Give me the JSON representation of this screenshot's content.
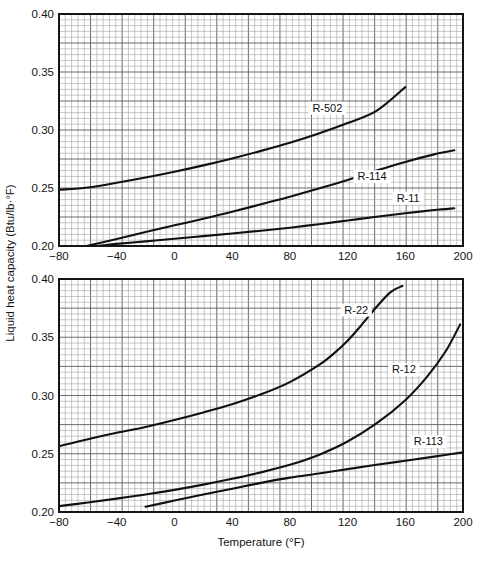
{
  "figure": {
    "axis_titles": {
      "y": "Liquid heat capacity (Btu/lb·°F)",
      "x": "Temperature (°F)"
    },
    "x_ticks": [
      "−80",
      "−40",
      "0",
      "40",
      "80",
      "120",
      "160",
      "200"
    ],
    "y_ticks": [
      "0.40",
      "0.35",
      "0.30",
      "0.25",
      "0.20"
    ],
    "grid_color": "#9a9a9a",
    "grid_major_color": "#5a5a5a",
    "frame_color": "#151515",
    "curve_color": "#111111"
  },
  "chart_data": [
    {
      "type": "line",
      "panel": "top",
      "title": "",
      "xlabel": "",
      "ylabel": "Liquid heat capacity (Btu/lb·°F)",
      "xlim": [
        -80,
        200
      ],
      "ylim": [
        0.2,
        0.4
      ],
      "x_ticks": [
        -80,
        -40,
        0,
        40,
        80,
        120,
        160,
        200
      ],
      "y_ticks": [
        0.2,
        0.25,
        0.3,
        0.35,
        0.4
      ],
      "grid": true,
      "legend": "inline-curve-labels",
      "series": [
        {
          "name": "R-502",
          "label": "R-502",
          "label_xy": [
            106,
            0.3175
          ],
          "x": [
            -80,
            -60,
            -40,
            -20,
            0,
            20,
            40,
            60,
            80,
            100,
            120,
            140,
            160
          ],
          "y": [
            0.2485,
            0.2505,
            0.2545,
            0.259,
            0.264,
            0.2695,
            0.2755,
            0.282,
            0.289,
            0.297,
            0.306,
            0.3165,
            0.337
          ]
        },
        {
          "name": "R-114",
          "label": "R-114",
          "label_xy": [
            137,
            0.2585
          ],
          "x": [
            -61,
            -40,
            -20,
            0,
            20,
            40,
            60,
            80,
            100,
            120,
            140,
            160,
            180,
            194
          ],
          "y": [
            0.2,
            0.206,
            0.212,
            0.2178,
            0.2235,
            0.2295,
            0.236,
            0.2425,
            0.2495,
            0.257,
            0.265,
            0.2725,
            0.279,
            0.2825
          ]
        },
        {
          "name": "R-11",
          "label": "R-11",
          "label_xy": [
            162,
            0.24
          ],
          "x": [
            -53,
            -40,
            -20,
            0,
            20,
            40,
            60,
            80,
            100,
            120,
            140,
            160,
            180,
            194
          ],
          "y": [
            0.2,
            0.2018,
            0.204,
            0.2062,
            0.2085,
            0.2108,
            0.2132,
            0.2158,
            0.2188,
            0.222,
            0.2252,
            0.2282,
            0.231,
            0.2325
          ]
        }
      ]
    },
    {
      "type": "line",
      "panel": "bottom",
      "title": "",
      "xlabel": "Temperature (°F)",
      "ylabel": "Liquid heat capacity (Btu/lb·°F)",
      "xlim": [
        -80,
        200
      ],
      "ylim": [
        0.2,
        0.4
      ],
      "x_ticks": [
        -80,
        -40,
        0,
        40,
        80,
        120,
        160,
        200
      ],
      "y_ticks": [
        0.2,
        0.25,
        0.3,
        0.35,
        0.4
      ],
      "grid": true,
      "legend": "inline-curve-labels",
      "series": [
        {
          "name": "R-22",
          "label": "R-22",
          "label_xy": [
            126,
            0.372
          ],
          "x": [
            -80,
            -60,
            -40,
            -20,
            0,
            20,
            40,
            60,
            80,
            100,
            110,
            120,
            130,
            140,
            150,
            158
          ],
          "y": [
            0.2565,
            0.2625,
            0.268,
            0.273,
            0.279,
            0.2855,
            0.2925,
            0.301,
            0.3115,
            0.326,
            0.3355,
            0.347,
            0.361,
            0.376,
            0.389,
            0.394
          ]
        },
        {
          "name": "R-12",
          "label": "R-12",
          "label_xy": [
            159,
            0.321
          ],
          "x": [
            -80,
            -60,
            -40,
            -20,
            0,
            20,
            40,
            60,
            80,
            100,
            120,
            140,
            160,
            175,
            188,
            198
          ],
          "y": [
            0.205,
            0.2082,
            0.2115,
            0.215,
            0.219,
            0.2235,
            0.2285,
            0.234,
            0.2405,
            0.249,
            0.2605,
            0.276,
            0.296,
            0.316,
            0.338,
            0.361
          ]
        },
        {
          "name": "R-113",
          "label": "R-113",
          "label_xy": [
            176,
            0.259
          ],
          "x": [
            -20,
            0,
            20,
            40,
            60,
            80,
            100,
            120,
            140,
            160,
            180,
            200
          ],
          "y": [
            0.2045,
            0.2098,
            0.215,
            0.22,
            0.225,
            0.2295,
            0.233,
            0.2368,
            0.2405,
            0.244,
            0.2475,
            0.2512
          ]
        }
      ]
    }
  ]
}
